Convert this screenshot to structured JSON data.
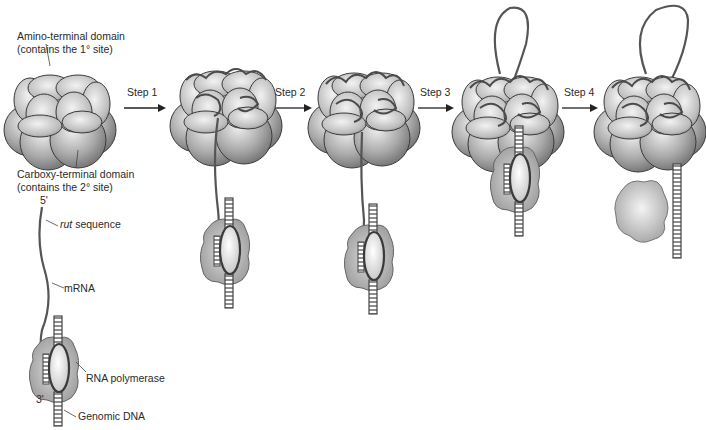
{
  "diagram": {
    "labels": {
      "amino_domain_line1": "Amino-terminal domain",
      "amino_domain_line2": "(contains the 1° site)",
      "carboxy_domain_line1": "Carboxy-terminal domain",
      "carboxy_domain_line2": "(contains the 2° site)",
      "five_prime": "5'",
      "three_prime": "3'",
      "rut_italic": "rut",
      "rut_rest": " sequence",
      "mrna": "mRNA",
      "rna_polymerase": "RNA polymerase",
      "genomic_dna": "Genomic DNA"
    },
    "steps": [
      {
        "label": "Step 1"
      },
      {
        "label": "Step 2"
      },
      {
        "label": "Step 3"
      },
      {
        "label": "Step 4"
      }
    ],
    "stages": [
      {
        "name": "rho-hexamer-free",
        "state": "Rho hexamer unbound"
      },
      {
        "name": "rho-bound-rut",
        "state": "mRNA bound at primary sites"
      },
      {
        "name": "rho-translocating",
        "state": "mRNA threading through secondary sites"
      },
      {
        "name": "rho-reaches-polymerase",
        "state": "Rho catches up with RNA polymerase"
      },
      {
        "name": "termination",
        "state": "RNA polymerase and DNA released"
      }
    ],
    "colors": {
      "sphere_light": "#e6e6e6",
      "sphere_dark": "#7a7a7a",
      "outline": "#3a3a3a",
      "rna": "#555555",
      "polymerase": "#a8a8a8"
    }
  }
}
